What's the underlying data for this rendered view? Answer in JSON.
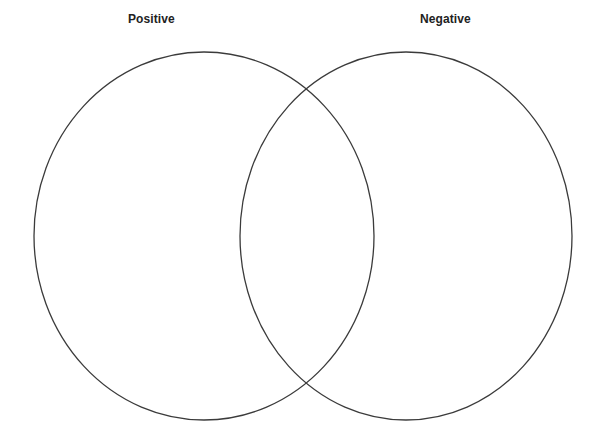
{
  "page": {
    "background_color": "#ffffff",
    "width": 607,
    "height": 436
  },
  "diagram": {
    "type": "venn-two-set",
    "stroke_color": "#3b3b3b",
    "fill_color": "none",
    "left_set": {
      "label": "Positive",
      "center_x": 204,
      "center_y": 236,
      "radius_x": 170,
      "radius_y": 184
    },
    "right_set": {
      "label": "Negative",
      "center_x": 406,
      "center_y": 236,
      "radius_x": 166,
      "radius_y": 184
    },
    "overlap": {
      "label": "",
      "content": ""
    },
    "left_only_content": "",
    "right_only_content": ""
  }
}
